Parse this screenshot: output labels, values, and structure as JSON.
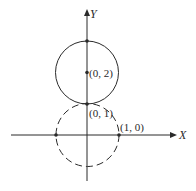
{
  "diagram": {
    "type": "coordinate-plane-circles",
    "axes": {
      "x_label": "X",
      "y_label": "Y"
    },
    "circles": [
      {
        "name": "upper-circle",
        "center": [
          0,
          2
        ],
        "radius": 1,
        "style": "solid"
      },
      {
        "name": "lower-circle",
        "center": [
          0,
          0
        ],
        "radius": 1,
        "style": "dashed"
      }
    ],
    "points": [
      {
        "name": "point-0-3",
        "coords": [
          0,
          3
        ],
        "label": ""
      },
      {
        "name": "point-0-2",
        "coords": [
          0,
          2
        ],
        "label": "(0, 2)"
      },
      {
        "name": "point-0-1",
        "coords": [
          0,
          1
        ],
        "label": "(0, 1)"
      },
      {
        "name": "point-1-0",
        "coords": [
          1,
          0
        ],
        "label": "(1, 0)"
      },
      {
        "name": "point-neg1-0",
        "coords": [
          -1,
          0
        ],
        "label": ""
      }
    ],
    "colors": {
      "stroke": "#2a2a2a",
      "background": "#ffffff"
    }
  }
}
